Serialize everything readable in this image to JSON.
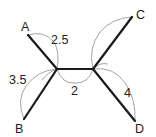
{
  "diagram": {
    "type": "graph-with-arc-lengths",
    "colors": {
      "edge": "#1a1a1a",
      "arc": "#9a9a9a",
      "text": "#222222",
      "background": "#ffffff"
    },
    "nodes": [
      {
        "id": "A",
        "label": "A",
        "x": 28,
        "y": 35,
        "label_x": 21,
        "label_y": 31
      },
      {
        "id": "B",
        "label": "B",
        "x": 24,
        "y": 119,
        "label_x": 15,
        "label_y": 133
      },
      {
        "id": "C",
        "label": "C",
        "x": 132,
        "y": 17,
        "label_x": 136,
        "label_y": 19
      },
      {
        "id": "D",
        "label": "D",
        "x": 135,
        "y": 121,
        "label_x": 135,
        "label_y": 133
      },
      {
        "id": "J1",
        "label": "",
        "x": 57,
        "y": 69
      },
      {
        "id": "J2",
        "label": "",
        "x": 93,
        "y": 69
      }
    ],
    "edges": [
      {
        "from": "A",
        "to": "J1",
        "length_label": "2.5",
        "label_x": 51,
        "label_y": 44
      },
      {
        "from": "B",
        "to": "J1",
        "length_label": "3.5",
        "label_x": 9,
        "label_y": 84
      },
      {
        "from": "J1",
        "to": "J2",
        "length_label": "2",
        "label_x": 71,
        "label_y": 95
      },
      {
        "from": "C",
        "to": "J2",
        "length_label": "",
        "label_x": 0,
        "label_y": 0
      },
      {
        "from": "D",
        "to": "J2",
        "length_label": "4",
        "label_x": 124,
        "label_y": 97
      }
    ],
    "labels": {
      "A": "A",
      "B": "B",
      "C": "C",
      "D": "D",
      "AJ": "2.5",
      "BJ": "3.5",
      "JJ": "2",
      "DJ": "4"
    }
  }
}
